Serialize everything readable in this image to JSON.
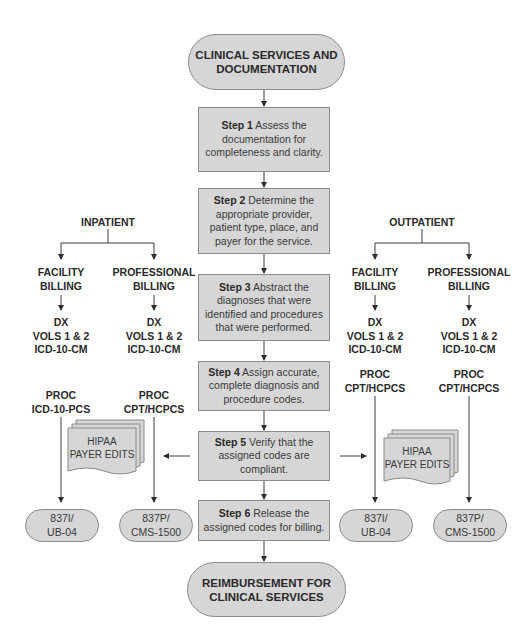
{
  "start": {
    "line1": "CLINICAL SERVICES AND",
    "line2": "DOCUMENTATION"
  },
  "end": {
    "line1": "REIMBURSEMENT FOR",
    "line2": "CLINICAL SERVICES"
  },
  "steps": [
    {
      "label": "Step 1",
      "text": "Assess the documentation for completeness and clarity."
    },
    {
      "label": "Step 2",
      "text": "Determine the appropriate provider, patient type, place, and payer for the service."
    },
    {
      "label": "Step 3",
      "text": "Abstract the diagnoses that were identified and procedures that were performed."
    },
    {
      "label": "Step 4",
      "text": "Assign accurate, complete diagnosis and procedure codes."
    },
    {
      "label": "Step 5",
      "text": "Verify that the assigned codes are compliant."
    },
    {
      "label": "Step 6",
      "text": "Release the assigned codes for billing."
    }
  ],
  "inpatient": {
    "title": "INPATIENT",
    "facility": {
      "title1": "FACILITY",
      "title2": "BILLING",
      "dx1": "DX",
      "dx2": "VOLS 1 & 2",
      "dx3": "ICD-10-CM",
      "proc1": "PROC",
      "proc2": "ICD-10-PCS",
      "form1": "837I/",
      "form2": "UB-04"
    },
    "professional": {
      "title1": "PROFESSIONAL",
      "title2": "BILLING",
      "dx1": "DX",
      "dx2": "VOLS 1 & 2",
      "dx3": "ICD-10-CM",
      "proc1": "PROC",
      "proc2": "CPT/HCPCS",
      "form1": "837P/",
      "form2": "CMS-1500"
    },
    "edits": {
      "line1": "HIPAA",
      "line2": "PAYER EDITS"
    }
  },
  "outpatient": {
    "title": "OUTPATIENT",
    "facility": {
      "title1": "FACILITY",
      "title2": "BILLING",
      "dx1": "DX",
      "dx2": "VOLS 1 & 2",
      "dx3": "ICD-10-CM",
      "proc1": "PROC",
      "proc2": "CPT/HCPCS",
      "form1": "837I/",
      "form2": "UB-04"
    },
    "professional": {
      "title1": "PROFESSIONAL",
      "title2": "BILLING",
      "dx1": "DX",
      "dx2": "VOLS 1 & 2",
      "dx3": "ICD-10-CM",
      "proc1": "PROC",
      "proc2": "CPT/HCPCS",
      "form1": "837P/",
      "form2": "CMS-1500"
    },
    "edits": {
      "line1": "HIPAA",
      "line2": "PAYER EDITS"
    }
  },
  "colors": {
    "box_fill": "#d6d6d6",
    "box_border": "#8a8a8a",
    "line": "#3a3a3a"
  }
}
